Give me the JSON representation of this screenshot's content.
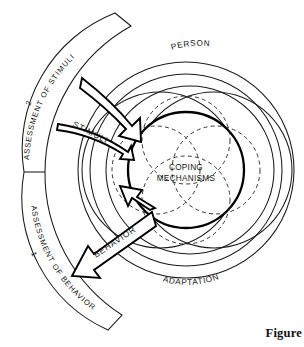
{
  "figure": {
    "caption": "Figure",
    "background_color": "#ffffff",
    "line_color": "#1a1a1a",
    "core_stroke_color": "#000000"
  },
  "core": {
    "label_line1": "COPING",
    "label_line2": "MECHANISMS"
  },
  "rings": {
    "outer_label": "PERSON",
    "lower_label": "ADAPTATION"
  },
  "flows": [
    {
      "name": "stimuli",
      "label": "STIMULI",
      "direction": "inward"
    },
    {
      "name": "behavior",
      "label": "BEHAVIOR",
      "direction": "outward"
    }
  ],
  "assessment_band": {
    "sections": [
      {
        "number": "2",
        "label": "ASSESSMENT OF STIMULI",
        "position": "upper"
      },
      {
        "number": "1",
        "label": "ASSESSMENT OF BEHAVIOR",
        "position": "lower"
      }
    ]
  }
}
